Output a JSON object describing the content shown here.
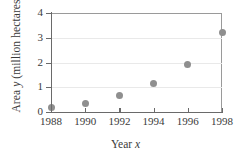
{
  "chart_data": {
    "type": "scatter",
    "title": "",
    "xlabel": "Year x",
    "xlabel_text": "Year ",
    "xlabel_var": "x",
    "ylabel": "Area y (million hectares)",
    "ylabel_prefix": "Area ",
    "ylabel_var": "y",
    "ylabel_suffix": " (million hectares)",
    "x": [
      1988,
      1990,
      1992,
      1994,
      1996,
      1998
    ],
    "values": [
      0.17,
      0.35,
      0.65,
      1.15,
      1.9,
      3.2
    ],
    "xlim": [
      1988,
      1998
    ],
    "ylim": [
      0,
      4
    ],
    "xticks": [
      "1988",
      "1990",
      "1992",
      "1994",
      "1996",
      "1998"
    ],
    "yticks": [
      "0",
      "1",
      "2",
      "3",
      "4"
    ],
    "grid": "horizontal",
    "legend": "none",
    "point_color": "#8f8f8f",
    "axis_color": "#6a6a6a",
    "grid_color": "#e9e9e9"
  }
}
